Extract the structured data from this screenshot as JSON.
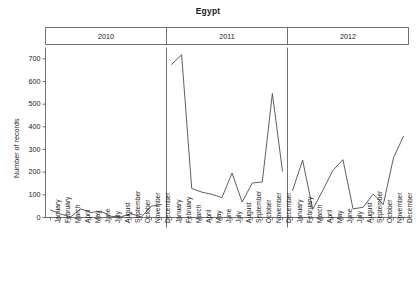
{
  "chart_data": {
    "type": "line",
    "title": "Egypt",
    "xlabel": "",
    "ylabel": "Number of records",
    "ylim": [
      0,
      750
    ],
    "yticks": [
      0,
      100,
      200,
      300,
      400,
      500,
      600,
      700
    ],
    "grid": false,
    "legend": "none",
    "panels": [
      {
        "label": "2010",
        "categories": [
          "January",
          "February",
          "March",
          "April",
          "May",
          "June",
          "July",
          "August",
          "September",
          "October",
          "November",
          "December"
        ],
        "values": [
          33,
          15,
          3,
          38,
          22,
          28,
          5,
          3,
          17,
          2,
          50,
          57
        ]
      },
      {
        "label": "2011",
        "categories": [
          "January",
          "February",
          "March",
          "April",
          "May",
          "June",
          "July",
          "August",
          "September",
          "October",
          "November",
          "December"
        ],
        "values": [
          675,
          718,
          128,
          112,
          102,
          88,
          196,
          68,
          152,
          157,
          547,
          205
        ]
      },
      {
        "label": "2012",
        "categories": [
          "January",
          "February",
          "March",
          "April",
          "May",
          "June",
          "July",
          "August",
          "September",
          "October",
          "November",
          "December"
        ],
        "values": [
          119,
          253,
          36,
          120,
          208,
          255,
          38,
          45,
          104,
          57,
          262,
          358
        ]
      }
    ],
    "categories": [
      "January",
      "February",
      "March",
      "April",
      "May",
      "June",
      "July",
      "August",
      "September",
      "October",
      "November",
      "December"
    ],
    "series": [
      {
        "name": "2010",
        "values": [
          33,
          15,
          3,
          38,
          22,
          28,
          5,
          3,
          17,
          2,
          50,
          57
        ]
      },
      {
        "name": "2011",
        "values": [
          675,
          718,
          128,
          112,
          102,
          88,
          196,
          68,
          152,
          157,
          547,
          205
        ]
      },
      {
        "name": "2012",
        "values": [
          119,
          253,
          36,
          120,
          208,
          255,
          38,
          45,
          104,
          57,
          262,
          358
        ]
      }
    ],
    "line_color": "#4d4d4d",
    "axis_color": "#4d4d4d"
  }
}
